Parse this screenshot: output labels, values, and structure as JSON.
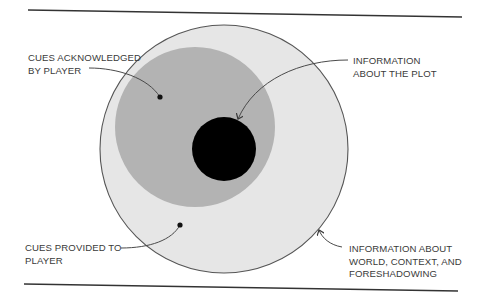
{
  "diagram": {
    "type": "nested-circles",
    "colors": {
      "background": "#ffffff",
      "outer_fill": "#e6e6e6",
      "outer_stroke": "#555555",
      "middle_fill": "#b3b3b3",
      "inner_fill": "#000000",
      "rule_line": "#333333",
      "leader_line": "#4a4a4a",
      "text": "#3a3a3a"
    },
    "circles": [
      {
        "id": "outer",
        "represents": "cues provided to player",
        "cx": 224,
        "cy": 149,
        "r": 124
      },
      {
        "id": "middle",
        "represents": "cues acknowledged by player",
        "cx": 195,
        "cy": 127,
        "r": 80
      },
      {
        "id": "inner",
        "represents": "information about the plot",
        "cx": 224,
        "cy": 149,
        "r": 32
      }
    ],
    "labels": {
      "cues_acknowledged": {
        "line1": "CUES ACKNOWLEDGED",
        "line2": "BY PLAYER"
      },
      "info_plot": {
        "line1": "INFORMATION",
        "line2": "ABOUT THE PLOT"
      },
      "cues_provided": {
        "line1": "CUES PROVIDED TO",
        "line2": "PLAYER"
      },
      "info_world": {
        "line1": "INFORMATION ABOUT",
        "line2": "WORLD, CONTEXT, AND",
        "line3": "FORESHADOWING"
      }
    }
  }
}
